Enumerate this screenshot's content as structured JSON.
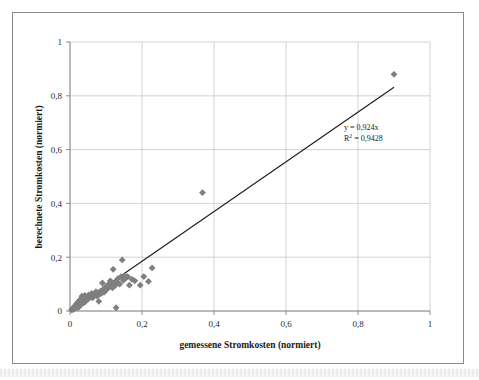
{
  "figure": {
    "kind": "scatter-plot-figure",
    "background_color": "#ffffff",
    "frame_color": "#8a8a8a"
  },
  "annotation": {
    "equation": "y = 0,924x",
    "r_squared_prefix": "R",
    "r_squared_sup": "2",
    "r_squared_value": " = 0,9428"
  },
  "chart_data": {
    "type": "scatter",
    "title": "",
    "xlabel": "gemessene Stromkosten (normiert)",
    "ylabel": "berechnete Stromkosten (normiert)",
    "xlim": [
      0,
      1
    ],
    "ylim": [
      0,
      1
    ],
    "xticks": [
      0,
      0.2,
      0.4,
      0.6,
      0.8,
      1
    ],
    "yticks": [
      0,
      0.2,
      0.4,
      0.6,
      0.8,
      1
    ],
    "xticklabels": [
      "0",
      "0,2",
      "0,4",
      "0,6",
      "0,8",
      "1"
    ],
    "yticklabels": [
      "0",
      "0,2",
      "0,4",
      "0,6",
      "0,8",
      "1"
    ],
    "grid": true,
    "grid_color": "#c8c8c8",
    "legend": false,
    "marker": "diamond",
    "marker_color": "#7f7f7f",
    "marker_size": 5,
    "series": [
      {
        "name": "Stromkosten",
        "points": [
          [
            0.004,
            0.004
          ],
          [
            0.006,
            0.006
          ],
          [
            0.007,
            0.01
          ],
          [
            0.008,
            0.005
          ],
          [
            0.01,
            0.012
          ],
          [
            0.011,
            0.008
          ],
          [
            0.012,
            0.016
          ],
          [
            0.013,
            0.01
          ],
          [
            0.014,
            0.019
          ],
          [
            0.015,
            0.013
          ],
          [
            0.016,
            0.022
          ],
          [
            0.017,
            0.012
          ],
          [
            0.018,
            0.026
          ],
          [
            0.019,
            0.017
          ],
          [
            0.02,
            0.029
          ],
          [
            0.021,
            0.02
          ],
          [
            0.022,
            0.033
          ],
          [
            0.023,
            0.022
          ],
          [
            0.024,
            0.014
          ],
          [
            0.025,
            0.036
          ],
          [
            0.026,
            0.026
          ],
          [
            0.027,
            0.04
          ],
          [
            0.028,
            0.031
          ],
          [
            0.03,
            0.044
          ],
          [
            0.031,
            0.024
          ],
          [
            0.032,
            0.034
          ],
          [
            0.033,
            0.055
          ],
          [
            0.035,
            0.038
          ],
          [
            0.036,
            0.049
          ],
          [
            0.038,
            0.03
          ],
          [
            0.04,
            0.042
          ],
          [
            0.041,
            0.058
          ],
          [
            0.043,
            0.035
          ],
          [
            0.045,
            0.046
          ],
          [
            0.047,
            0.052
          ],
          [
            0.05,
            0.044
          ],
          [
            0.052,
            0.06
          ],
          [
            0.055,
            0.05
          ],
          [
            0.058,
            0.056
          ],
          [
            0.06,
            0.065
          ],
          [
            0.063,
            0.049
          ],
          [
            0.066,
            0.058
          ],
          [
            0.07,
            0.064
          ],
          [
            0.072,
            0.072
          ],
          [
            0.075,
            0.055
          ],
          [
            0.078,
            0.068
          ],
          [
            0.08,
            0.036
          ],
          [
            0.082,
            0.062
          ],
          [
            0.085,
            0.074
          ],
          [
            0.088,
            0.066
          ],
          [
            0.09,
            0.104
          ],
          [
            0.092,
            0.08
          ],
          [
            0.095,
            0.07
          ],
          [
            0.098,
            0.088
          ],
          [
            0.1,
            0.078
          ],
          [
            0.103,
            0.094
          ],
          [
            0.105,
            0.084
          ],
          [
            0.108,
            0.1
          ],
          [
            0.11,
            0.09
          ],
          [
            0.112,
            0.112
          ],
          [
            0.115,
            0.096
          ],
          [
            0.118,
            0.086
          ],
          [
            0.12,
            0.155
          ],
          [
            0.122,
            0.104
          ],
          [
            0.125,
            0.094
          ],
          [
            0.128,
            0.012
          ],
          [
            0.13,
            0.108
          ],
          [
            0.133,
            0.12
          ],
          [
            0.138,
            0.1
          ],
          [
            0.142,
            0.128
          ],
          [
            0.145,
            0.19
          ],
          [
            0.148,
            0.114
          ],
          [
            0.152,
            0.132
          ],
          [
            0.155,
            0.122
          ],
          [
            0.16,
            0.128
          ],
          [
            0.165,
            0.096
          ],
          [
            0.172,
            0.118
          ],
          [
            0.18,
            0.112
          ],
          [
            0.195,
            0.096
          ],
          [
            0.205,
            0.128
          ],
          [
            0.218,
            0.11
          ],
          [
            0.228,
            0.16
          ],
          [
            0.368,
            0.44
          ],
          [
            0.9,
            0.88
          ]
        ]
      }
    ],
    "trendline": {
      "type": "linear-through-origin",
      "slope": 0.924,
      "intercept": 0,
      "color": "#1a1a1a",
      "x_start": 0,
      "x_end": 0.9,
      "equation_label": "y = 0,924x",
      "r_squared": 0.9428
    }
  }
}
